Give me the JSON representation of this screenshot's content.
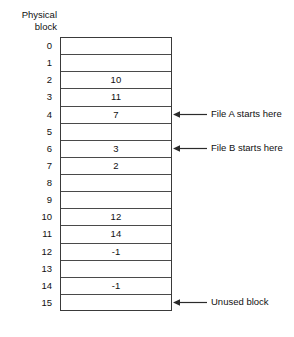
{
  "figure": {
    "column_header": {
      "line1": "Physical",
      "line2": "block"
    },
    "colors": {
      "background": "#ffffff",
      "table_border": "#3a3a3a",
      "row_divider": "#4a4a4a",
      "text": "#111111",
      "arrow": "#2b2b2b"
    },
    "rows": [
      {
        "index": "0",
        "value": ""
      },
      {
        "index": "1",
        "value": ""
      },
      {
        "index": "2",
        "value": "10"
      },
      {
        "index": "3",
        "value": "11"
      },
      {
        "index": "4",
        "value": "7"
      },
      {
        "index": "5",
        "value": ""
      },
      {
        "index": "6",
        "value": "3"
      },
      {
        "index": "7",
        "value": "2"
      },
      {
        "index": "8",
        "value": ""
      },
      {
        "index": "9",
        "value": ""
      },
      {
        "index": "10",
        "value": "12"
      },
      {
        "index": "11",
        "value": "14"
      },
      {
        "index": "12",
        "value": "-1"
      },
      {
        "index": "13",
        "value": ""
      },
      {
        "index": "14",
        "value": "-1"
      },
      {
        "index": "15",
        "value": ""
      }
    ],
    "annotations": [
      {
        "row": 4,
        "label": "File A starts here",
        "icon": "left-arrow-icon"
      },
      {
        "row": 6,
        "label": "File B starts here",
        "icon": "left-arrow-icon"
      },
      {
        "row": 15,
        "label": "Unused block",
        "icon": "left-arrow-icon"
      }
    ]
  }
}
